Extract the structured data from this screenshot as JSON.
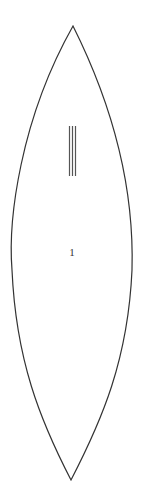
{
  "diagram": {
    "shape": "lens",
    "label": "1",
    "mark": {
      "type": "vertical-lines",
      "count": 3
    },
    "colors": {
      "stroke": "#333333",
      "background": "#ffffff"
    }
  }
}
